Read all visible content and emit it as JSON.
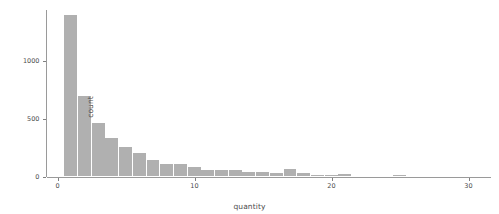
{
  "chart_data": {
    "type": "bar",
    "title": "",
    "xlabel": "quantity",
    "ylabel": "count",
    "xlim": [
      -0.6,
      31.5
    ],
    "ylim": [
      0,
      1450
    ],
    "grid": false,
    "legend": null,
    "bar_color": "#b0b0b0",
    "binwidth": 1,
    "x_ticks": [
      0,
      10,
      20,
      30
    ],
    "x_tick_labels": [
      "0",
      "10",
      "20",
      "30"
    ],
    "y_ticks": [
      0,
      500,
      1000
    ],
    "y_tick_labels": [
      "0",
      "500",
      "1000"
    ],
    "categories": [
      1,
      2,
      3,
      4,
      5,
      6,
      7,
      8,
      9,
      10,
      11,
      12,
      13,
      14,
      15,
      16,
      17,
      18,
      19,
      20,
      21,
      22,
      23,
      24,
      25,
      26,
      27,
      28,
      29,
      30,
      31
    ],
    "values": [
      1402,
      701,
      459,
      330,
      258,
      200,
      145,
      110,
      112,
      85,
      60,
      58,
      57,
      40,
      38,
      30,
      62,
      30,
      10,
      9,
      20,
      8,
      6,
      5,
      12,
      4,
      2,
      2,
      1,
      1,
      3
    ]
  },
  "axes": {
    "x_title": "quantity",
    "y_title": "count"
  }
}
